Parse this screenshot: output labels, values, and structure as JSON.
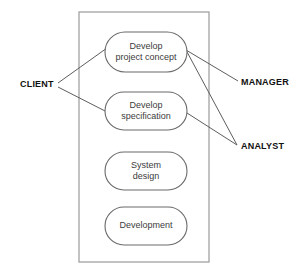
{
  "diagram": {
    "type": "process-roles-diagram",
    "container": {
      "name": "process-container",
      "x": 79,
      "y": 12,
      "width": 130,
      "height": 250
    },
    "stages": [
      {
        "id": "develop-project-concept",
        "lines": [
          "Develop",
          "project concept"
        ],
        "x": 105,
        "y": 32,
        "width": 82,
        "height": 40
      },
      {
        "id": "develop-specification",
        "lines": [
          "Develop",
          "specification"
        ],
        "x": 105,
        "y": 92,
        "width": 82,
        "height": 38
      },
      {
        "id": "system-design",
        "lines": [
          "System",
          "design"
        ],
        "x": 105,
        "y": 152,
        "width": 82,
        "height": 38
      },
      {
        "id": "development",
        "lines": [
          "Development"
        ],
        "x": 105,
        "y": 207,
        "width": 82,
        "height": 38
      }
    ],
    "roles": [
      {
        "id": "client",
        "label": "CLIENT",
        "x": 20,
        "y": 85,
        "side": "left"
      },
      {
        "id": "manager",
        "label": "MANAGER",
        "x": 241,
        "y": 83,
        "side": "right"
      },
      {
        "id": "analyst",
        "label": "ANALYST",
        "x": 241,
        "y": 147,
        "side": "right"
      }
    ],
    "connectors": [
      {
        "id": "client-to-concept",
        "from": "client",
        "to": "develop-project-concept",
        "x1": 58,
        "y1": 83,
        "x2": 107,
        "y2": 48
      },
      {
        "id": "client-to-specification",
        "from": "client",
        "to": "develop-specification",
        "x1": 58,
        "y1": 87,
        "x2": 107,
        "y2": 112
      },
      {
        "id": "concept-to-manager",
        "from": "develop-project-concept",
        "to": "manager",
        "x1": 186,
        "y1": 50,
        "x2": 238,
        "y2": 81
      },
      {
        "id": "concept-to-analyst",
        "from": "develop-project-concept",
        "to": "analyst",
        "x1": 186,
        "y1": 50,
        "x2": 237,
        "y2": 145
      },
      {
        "id": "specification-to-analyst",
        "from": "develop-specification",
        "to": "analyst",
        "x1": 187,
        "y1": 113,
        "x2": 237,
        "y2": 145
      }
    ],
    "colors": {
      "background": "#ffffff",
      "container_stroke": "#9a9a9a",
      "shape_stroke": "#6a6a6a",
      "connector_stroke": "#5d5d5d",
      "stage_text": "#3c3c3c",
      "role_text": "#111111"
    }
  }
}
